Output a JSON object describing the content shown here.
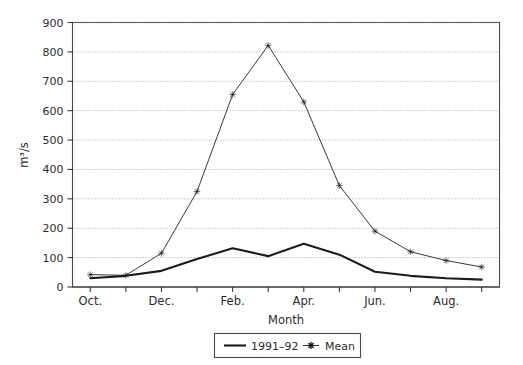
{
  "chart_data": {
    "type": "line",
    "title": "",
    "xlabel": "Month",
    "ylabel": "m³/s",
    "ylim": [
      0,
      900
    ],
    "ytick_step": 100,
    "yticks": [
      0,
      100,
      200,
      300,
      400,
      500,
      600,
      700,
      800,
      900
    ],
    "ytick_labels": [
      "0",
      "100",
      "200",
      "300",
      "400",
      "500",
      "600",
      "700",
      "800",
      "900"
    ],
    "grid": "horizontal-dotted",
    "categories": [
      "Oct.",
      "Nov.",
      "Dec.",
      "Jan.",
      "Feb.",
      "Mar.",
      "Apr.",
      "May",
      "Jun.",
      "Jul.",
      "Aug.",
      "Sep."
    ],
    "xtick_labels_shown": [
      "Oct.",
      "",
      "Dec.",
      "",
      "Feb.",
      "",
      "Apr.",
      "",
      "Jun.",
      "",
      "Aug.",
      ""
    ],
    "legend_position": "below-axes-centered",
    "series": [
      {
        "name": "1991–92",
        "marker": "none",
        "color": "#1b1b1b",
        "values": [
          30,
          38,
          55,
          95,
          132,
          105,
          147,
          110,
          52,
          38,
          30,
          25
        ]
      },
      {
        "name": "Mean",
        "marker": "asterisk",
        "color": "#3a3a3a",
        "values": [
          42,
          40,
          115,
          325,
          655,
          822,
          630,
          345,
          190,
          120,
          90,
          68
        ]
      }
    ]
  },
  "axes": {
    "y_axis_title": "m³/s",
    "x_axis_title": "Month"
  },
  "legend": {
    "entries": [
      {
        "label": "1991–92",
        "style": "solid-line"
      },
      {
        "label": "Mean",
        "style": "asterisk-marker"
      }
    ]
  }
}
